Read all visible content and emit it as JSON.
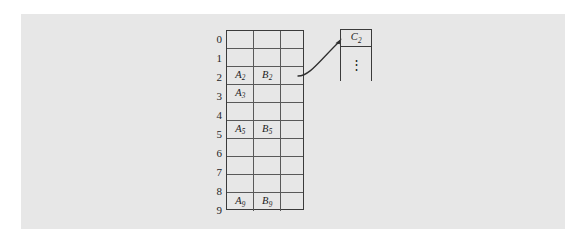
{
  "figure": {
    "type": "array-with-overflow-pointer",
    "row_count": 10,
    "column_count": 3,
    "row_indices": [
      "0",
      "1",
      "2",
      "3",
      "4",
      "5",
      "6",
      "7",
      "8",
      "9"
    ],
    "rows": [
      {
        "index": "0",
        "a": "",
        "b": "",
        "c": ""
      },
      {
        "index": "1",
        "a": "",
        "b": "",
        "c": ""
      },
      {
        "index": "2",
        "a": "A2",
        "b": "B2",
        "c": ""
      },
      {
        "index": "3",
        "a": "A3",
        "b": "",
        "c": ""
      },
      {
        "index": "4",
        "a": "",
        "b": "",
        "c": ""
      },
      {
        "index": "5",
        "a": "A5",
        "b": "B5",
        "c": ""
      },
      {
        "index": "6",
        "a": "",
        "b": "",
        "c": ""
      },
      {
        "index": "7",
        "a": "",
        "b": "",
        "c": ""
      },
      {
        "index": "8",
        "a": "",
        "b": "",
        "c": ""
      },
      {
        "index": "9",
        "a": "A9",
        "b": "B9",
        "c": ""
      }
    ],
    "overflow_box": {
      "head_label": "C2",
      "continuation_glyph": "⋮"
    },
    "pointer": {
      "from_row_index": "2",
      "from_column": "c",
      "to": "overflow_box",
      "style": "curved-arrow"
    },
    "colors": {
      "plate_background": "#e7e7e7",
      "page_background": "#ffffff",
      "outer_border": "#3b3b3b",
      "grid_line": "#595959",
      "text": "#222222"
    }
  }
}
